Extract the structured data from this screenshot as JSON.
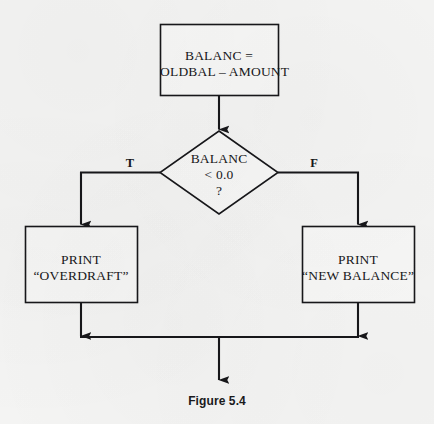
{
  "figure": {
    "caption": "Figure 5.4",
    "background_color": "#f4f4f3",
    "ink_color": "#17171a"
  },
  "diagram": {
    "type": "flowchart",
    "title": "Figure 5.4",
    "nodes": [
      {
        "id": "process-balance",
        "shape": "rectangle",
        "kind": "process",
        "lines": [
          "BALANC =",
          "OLDBAL – AMOUNT"
        ]
      },
      {
        "id": "decision-balance",
        "shape": "diamond",
        "kind": "decision",
        "lines": [
          "BALANC",
          "< 0.0",
          "?"
        ]
      },
      {
        "id": "process-print-overdraft",
        "shape": "rectangle",
        "kind": "process",
        "lines": [
          "PRINT",
          "“OVERDRAFT”"
        ]
      },
      {
        "id": "process-print-new-balance",
        "shape": "rectangle",
        "kind": "process",
        "lines": [
          "PRINT",
          "“NEW BALANCE”"
        ]
      }
    ],
    "branch_labels": {
      "true": "T",
      "false": "F"
    },
    "edges": [
      {
        "from": "process-balance",
        "to": "decision-balance",
        "label": ""
      },
      {
        "from": "decision-balance",
        "to": "process-print-overdraft",
        "label": "T"
      },
      {
        "from": "decision-balance",
        "to": "process-print-new-balance",
        "label": "F"
      },
      {
        "from": "process-print-overdraft",
        "to": "merge-point",
        "label": ""
      },
      {
        "from": "process-print-new-balance",
        "to": "merge-point",
        "label": ""
      },
      {
        "from": "merge-point",
        "to": "exit",
        "label": ""
      }
    ]
  }
}
